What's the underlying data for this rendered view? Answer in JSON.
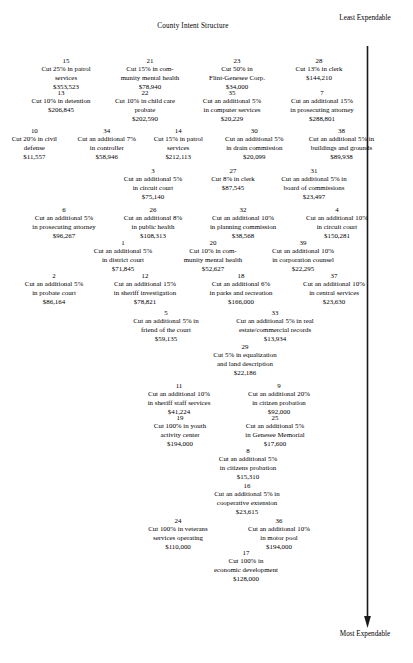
{
  "title": "County Intent Structure",
  "scale": {
    "top_label": "Least\nExpendable",
    "bottom_label": "Most\nExpendable",
    "arrow_direction": "down",
    "arrow_color": "#1a1a1a"
  },
  "chart_data": {
    "type": "table",
    "title": "County Intent Structure",
    "xlabel": "",
    "ylabel": "Expendability",
    "legend": [
      "Least Expendable (top)",
      "Most Expendable (bottom)"
    ],
    "columns": [
      "rank",
      "description",
      "amount"
    ],
    "rows": [
      {
        "rank": "15",
        "description": "Cut 25% in patrol\nservices",
        "amount": "$353,523"
      },
      {
        "rank": "21",
        "description": "Cut 15% in com-\nmunity mental health",
        "amount": "$78,940"
      },
      {
        "rank": "23",
        "description": "Cut 50% in\nFlint-Genesee Corp.",
        "amount": "$34,000"
      },
      {
        "rank": "28",
        "description": "Cut 13% in clerk",
        "amount": "$144,210"
      },
      {
        "rank": "13",
        "description": "Cut 10% in detention",
        "amount": "$206,845"
      },
      {
        "rank": "22",
        "description": "Cut 10% in child care\nprobate",
        "amount": "$202,590"
      },
      {
        "rank": "35",
        "description": "Cut an additional 5%\nin computer services",
        "amount": "$20,229"
      },
      {
        "rank": "7",
        "description": "Cut an additional 15%\nin prosecuting attorney",
        "amount": "$288,801"
      },
      {
        "rank": "10",
        "description": "Cut 20% in civil\ndefense",
        "amount": "$11,557"
      },
      {
        "rank": "34",
        "description": "Cut an additional 7%\nin controller",
        "amount": "$58,946"
      },
      {
        "rank": "14",
        "description": "Cut 15% in patrol\nservices",
        "amount": "$212,113"
      },
      {
        "rank": "30",
        "description": "Cut an additional 5%\nin drain commission",
        "amount": "$20,099"
      },
      {
        "rank": "38",
        "description": "Cut an additional 5% in\nbuildings and grounds",
        "amount": "$89,938"
      },
      {
        "rank": "3",
        "description": "Cut an additional 5%\nin circuit court",
        "amount": "$75,140"
      },
      {
        "rank": "27",
        "description": "Cut 8% in clerk",
        "amount": "$87,545"
      },
      {
        "rank": "31",
        "description": "Cut an additional 5% in\nboard of commissions",
        "amount": "$23,497"
      },
      {
        "rank": "6",
        "description": "Cut an additional 5%\nin prosecuting attorney",
        "amount": "$96,267"
      },
      {
        "rank": "26",
        "description": "Cut an additional 8%\nin public health",
        "amount": "$108,313"
      },
      {
        "rank": "32",
        "description": "Cut an additional 10%\nin planning commission",
        "amount": "$38,568"
      },
      {
        "rank": "4",
        "description": "Cut an additional 10%\nin circuit court",
        "amount": "$150,281"
      },
      {
        "rank": "1",
        "description": "Cut an additional 5%\nin district court",
        "amount": "$71,845"
      },
      {
        "rank": "20",
        "description": "Cut 10% in com-\nmunity mental health",
        "amount": "$52,627"
      },
      {
        "rank": "39",
        "description": "Cut an additional 10%\nin corporation counsel",
        "amount": "$22,295"
      },
      {
        "rank": "2",
        "description": "Cut an additional 5%\nin probate court",
        "amount": "$86,164"
      },
      {
        "rank": "12",
        "description": "Cut an additional 15%\nin sheriff investigation",
        "amount": "$78,821"
      },
      {
        "rank": "18",
        "description": "Cut an additional 6%\nin parks and recreation",
        "amount": "$166,000"
      },
      {
        "rank": "37",
        "description": "Cut an additional 10%\nin central services",
        "amount": "$23,630"
      },
      {
        "rank": "5",
        "description": "Cut an additional 5% in\nfriend of the court",
        "amount": "$59,135"
      },
      {
        "rank": "33",
        "description": "Cut an additional 5% in real\nestate/commercial records",
        "amount": "$13,934"
      },
      {
        "rank": "29",
        "description": "Cut 5% in equalization\nand land description",
        "amount": "$22,186"
      },
      {
        "rank": "11",
        "description": "Cut an additional 10%\nin sheriff staff services",
        "amount": "$41,224"
      },
      {
        "rank": "9",
        "description": "Cut an additional 20%\nin citizen probation",
        "amount": "$92,000"
      },
      {
        "rank": "19",
        "description": "Cut 100% in youth\nactivity center",
        "amount": "$194,000"
      },
      {
        "rank": "25",
        "description": "Cut an additional 5%\nin Genesee Memorial",
        "amount": "$17,600"
      },
      {
        "rank": "8",
        "description": "Cut an additional 5%\nin citizens probation",
        "amount": "$15,310"
      },
      {
        "rank": "16",
        "description": "Cut an additional 5% in\ncooperative extension",
        "amount": "$23,615"
      },
      {
        "rank": "24",
        "description": "Cut 100% in veterans\nservices operating",
        "amount": "$110,000"
      },
      {
        "rank": "36",
        "description": "Cut an additional 10%\nin motor pool",
        "amount": "$194,000"
      },
      {
        "rank": "17",
        "description": "Cut 100% in\neconomic development",
        "amount": "$128,000"
      }
    ]
  },
  "layout": {
    "rows": [
      {
        "top": 56,
        "indices": [
          0,
          1,
          2,
          3
        ],
        "widths": [
          78,
          90,
          84,
          80
        ],
        "offset": 0
      },
      {
        "top": 88,
        "indices": [
          4,
          5,
          6,
          7
        ],
        "widths": [
          82,
          86,
          88,
          92
        ],
        "offset": 2
      },
      {
        "top": 126,
        "indices": [
          8,
          9,
          10,
          11,
          12
        ],
        "widths": [
          74,
          82,
          72,
          92,
          96
        ],
        "offset": 0
      },
      {
        "top": 166,
        "indices": [
          13,
          14,
          15
        ],
        "widths": [
          92,
          68,
          94
        ],
        "offset": 82
      },
      {
        "top": 205,
        "indices": [
          16,
          17,
          18,
          19
        ],
        "widths": [
          98,
          80,
          100,
          88
        ],
        "offset": 10
      },
      {
        "top": 238,
        "indices": [
          20,
          21,
          22
        ],
        "widths": [
          94,
          86,
          94
        ],
        "offset": 40
      },
      {
        "top": 271,
        "indices": [
          23,
          24,
          25,
          26
        ],
        "widths": [
          88,
          94,
          98,
          88
        ],
        "offset": 2
      },
      {
        "top": 308,
        "indices": [
          27,
          28
        ],
        "widths": [
          104,
          114
        ],
        "offset": 60
      },
      {
        "top": 342,
        "indices": [
          29
        ],
        "widths": [
          116
        ],
        "offset": 104
      },
      {
        "top": 381,
        "indices": [
          30,
          31
        ],
        "widths": [
          104,
          96
        ],
        "offset": 68
      },
      {
        "top": 413,
        "indices": [
          32,
          33
        ],
        "widths": [
          92,
          98
        ],
        "offset": 72
      },
      {
        "top": 446,
        "indices": [
          34
        ],
        "widths": [
          104
        ],
        "offset": 110
      },
      {
        "top": 481,
        "indices": [
          35
        ],
        "widths": [
          110
        ],
        "offset": 108
      },
      {
        "top": 516,
        "indices": [
          36,
          37
        ],
        "widths": [
          104,
          98
        ],
        "offset": 68
      },
      {
        "top": 548,
        "indices": [
          38
        ],
        "widths": [
          110
        ],
        "offset": 106
      }
    ]
  }
}
